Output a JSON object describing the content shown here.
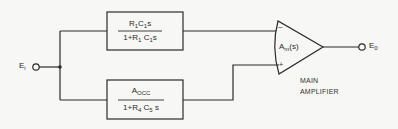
{
  "diagram": {
    "type": "block-diagram",
    "input": {
      "label": "E",
      "subscript": "i"
    },
    "output": {
      "label": "E",
      "subscript": "0"
    },
    "blocks": [
      {
        "id": "top-block",
        "numerator": {
          "parts": [
            "R",
            "1",
            "C",
            "1",
            "s"
          ]
        },
        "denominator": {
          "parts": [
            "1+R",
            "1",
            " C",
            "1",
            "s"
          ]
        }
      },
      {
        "id": "bottom-block",
        "numerator": {
          "parts": [
            "A",
            "OCC"
          ]
        },
        "denominator": {
          "parts": [
            "1+R",
            "4",
            " C",
            "5",
            " s"
          ]
        }
      }
    ],
    "amplifier": {
      "gain_label": "A",
      "gain_subscript": "m",
      "gain_suffix": "(s)",
      "inverting_sign": "–",
      "noninverting_sign": "+",
      "caption_line1": "MAIN",
      "caption_line2": "AMPLIFIER"
    },
    "connections": [
      "Ei -> junction",
      "junction -> top-block -> amplifier(-)",
      "junction -> bottom-block -> amplifier(+)",
      "amplifier -> E0"
    ]
  }
}
